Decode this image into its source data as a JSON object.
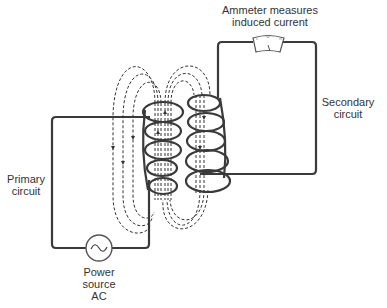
{
  "labels": {
    "ammeter": [
      "Ammeter measures",
      "induced current"
    ],
    "secondary": [
      "Secondary",
      "circuit"
    ],
    "primary": [
      "Primary",
      "circuit"
    ],
    "source": [
      "Power",
      "source",
      "AC"
    ]
  },
  "components": {
    "primary_coil_turns": 5,
    "secondary_coil_turns": 5,
    "source_symbol": "~",
    "meter_marks": [
      "-",
      "0",
      "+"
    ]
  },
  "colors": {
    "line": "#3a3a3a",
    "text": "#333333",
    "background": "#ffffff"
  }
}
